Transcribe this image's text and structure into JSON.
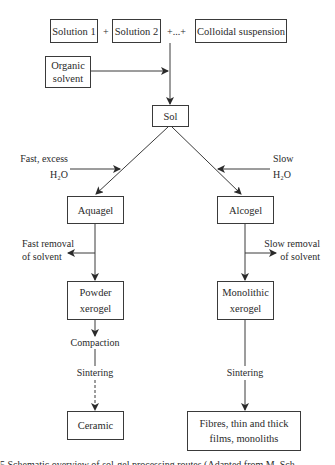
{
  "diagram": {
    "inputs": {
      "solution1": "Solution 1",
      "plus1": "+",
      "solution2": "Solution 2",
      "plus_ellipsis": "+...+",
      "colloidal": "Colloidal suspension"
    },
    "organic_solvent": "Organic\nsolvent",
    "sol": "Sol",
    "left_branch": {
      "water_label_line1": "Fast, excess",
      "water_label_line2": "H₂O",
      "gel": "Aquagel",
      "removal_line1": "Fast removal",
      "removal_line2": "of solvent",
      "xerogel_line1": "Powder",
      "xerogel_line2": "xerogel",
      "step1": "Compaction",
      "step2": "Sintering",
      "product": "Ceramic"
    },
    "right_branch": {
      "water_label_line1": "Slow",
      "water_label_line2": "H₂O",
      "gel": "Alcogel",
      "removal_line1": "Slow removal",
      "removal_line2": "of solvent",
      "xerogel_line1": "Monolithic",
      "xerogel_line2": "xerogel",
      "step1": "Sintering",
      "product_line1": "Fibres, thin and thick",
      "product_line2": "films, monoliths"
    },
    "caption": "5 Schematic overview of sol-gel processing routes (Adapted from M. Sch..."
  },
  "colors": {
    "line": "#3a3a3a",
    "text": "#2a2a2a",
    "background": "#ffffff"
  }
}
